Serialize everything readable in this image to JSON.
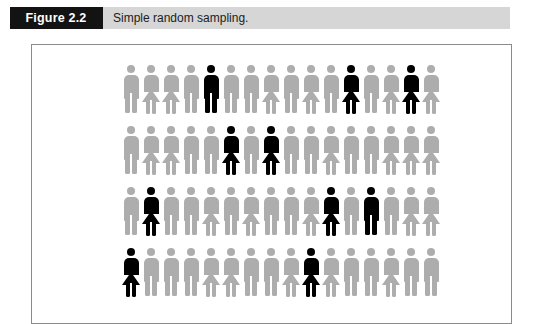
{
  "figure": {
    "number_label": "Figure 2.2",
    "caption": "Simple random sampling."
  },
  "colors": {
    "banner_background": "#d6d6d6",
    "number_box_background": "#131313",
    "population_gray": "#adadad",
    "sample_black": "#000000",
    "frame_border": "#8b8b8b",
    "page_background": "#ffffff"
  },
  "chart_data": {
    "type": "pictogram",
    "title": "Simple random sampling.",
    "xlabel": "",
    "ylabel": "",
    "legend": [
      {
        "label": "population member (not sampled)",
        "color": "#adadad"
      },
      {
        "label": "sampled member",
        "color": "#000000"
      }
    ],
    "columns": 16,
    "rows": 4,
    "total_people": 64,
    "sampled_count": 10,
    "population_count": 54,
    "icon_types": [
      "male",
      "female"
    ],
    "sampled_positions": [
      {
        "row": 1,
        "col": 5,
        "gender": "male"
      },
      {
        "row": 1,
        "col": 12,
        "gender": "female"
      },
      {
        "row": 1,
        "col": 15,
        "gender": "female"
      },
      {
        "row": 2,
        "col": 6,
        "gender": "female"
      },
      {
        "row": 2,
        "col": 8,
        "gender": "female"
      },
      {
        "row": 3,
        "col": 2,
        "gender": "female"
      },
      {
        "row": 3,
        "col": 11,
        "gender": "female"
      },
      {
        "row": 3,
        "col": 13,
        "gender": "male"
      },
      {
        "row": 4,
        "col": 1,
        "gender": "female"
      },
      {
        "row": 4,
        "col": 10,
        "gender": "female"
      }
    ],
    "grid": [
      [
        {
          "gender": "male",
          "sampled": false
        },
        {
          "gender": "female",
          "sampled": false
        },
        {
          "gender": "female",
          "sampled": false
        },
        {
          "gender": "male",
          "sampled": false
        },
        {
          "gender": "male",
          "sampled": true
        },
        {
          "gender": "male",
          "sampled": false
        },
        {
          "gender": "male",
          "sampled": false
        },
        {
          "gender": "female",
          "sampled": false
        },
        {
          "gender": "male",
          "sampled": false
        },
        {
          "gender": "female",
          "sampled": false
        },
        {
          "gender": "male",
          "sampled": false
        },
        {
          "gender": "female",
          "sampled": true
        },
        {
          "gender": "male",
          "sampled": false
        },
        {
          "gender": "female",
          "sampled": false
        },
        {
          "gender": "female",
          "sampled": true
        },
        {
          "gender": "female",
          "sampled": false
        }
      ],
      [
        {
          "gender": "male",
          "sampled": false
        },
        {
          "gender": "female",
          "sampled": false
        },
        {
          "gender": "female",
          "sampled": false
        },
        {
          "gender": "male",
          "sampled": false
        },
        {
          "gender": "male",
          "sampled": false
        },
        {
          "gender": "female",
          "sampled": true
        },
        {
          "gender": "male",
          "sampled": false
        },
        {
          "gender": "female",
          "sampled": true
        },
        {
          "gender": "male",
          "sampled": false
        },
        {
          "gender": "male",
          "sampled": false
        },
        {
          "gender": "female",
          "sampled": false
        },
        {
          "gender": "male",
          "sampled": false
        },
        {
          "gender": "male",
          "sampled": false
        },
        {
          "gender": "female",
          "sampled": false
        },
        {
          "gender": "female",
          "sampled": false
        },
        {
          "gender": "female",
          "sampled": false
        }
      ],
      [
        {
          "gender": "male",
          "sampled": false
        },
        {
          "gender": "female",
          "sampled": true
        },
        {
          "gender": "male",
          "sampled": false
        },
        {
          "gender": "male",
          "sampled": false
        },
        {
          "gender": "female",
          "sampled": false
        },
        {
          "gender": "male",
          "sampled": false
        },
        {
          "gender": "female",
          "sampled": false
        },
        {
          "gender": "male",
          "sampled": false
        },
        {
          "gender": "male",
          "sampled": false
        },
        {
          "gender": "female",
          "sampled": false
        },
        {
          "gender": "female",
          "sampled": true
        },
        {
          "gender": "male",
          "sampled": false
        },
        {
          "gender": "male",
          "sampled": true
        },
        {
          "gender": "male",
          "sampled": false
        },
        {
          "gender": "female",
          "sampled": false
        },
        {
          "gender": "female",
          "sampled": false
        }
      ],
      [
        {
          "gender": "female",
          "sampled": true
        },
        {
          "gender": "male",
          "sampled": false
        },
        {
          "gender": "male",
          "sampled": false
        },
        {
          "gender": "male",
          "sampled": false
        },
        {
          "gender": "female",
          "sampled": false
        },
        {
          "gender": "female",
          "sampled": false
        },
        {
          "gender": "male",
          "sampled": false
        },
        {
          "gender": "male",
          "sampled": false
        },
        {
          "gender": "female",
          "sampled": false
        },
        {
          "gender": "female",
          "sampled": true
        },
        {
          "gender": "female",
          "sampled": false
        },
        {
          "gender": "male",
          "sampled": false
        },
        {
          "gender": "male",
          "sampled": false
        },
        {
          "gender": "female",
          "sampled": false
        },
        {
          "gender": "male",
          "sampled": false
        },
        {
          "gender": "male",
          "sampled": false
        }
      ]
    ]
  }
}
